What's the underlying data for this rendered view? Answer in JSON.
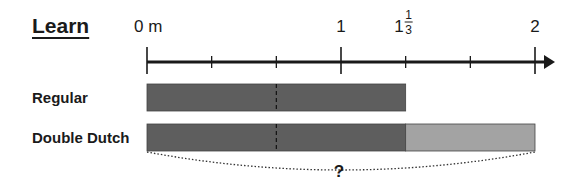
{
  "heading": "Learn",
  "number_line": {
    "unit": "m",
    "min": 0,
    "max": 2,
    "labels": [
      {
        "value": 0,
        "text": "0 m"
      },
      {
        "value": 1,
        "text": "1"
      },
      {
        "value": 1.3333,
        "whole": "1",
        "numerator": "1",
        "denominator": "3"
      },
      {
        "value": 2,
        "text": "2"
      }
    ],
    "major_ticks": [
      0,
      1,
      2
    ],
    "minor_ticks": [
      0.3333,
      0.6667,
      1.3333,
      1.6667
    ]
  },
  "bars": [
    {
      "label": "Regular",
      "segments": [
        {
          "from": 0,
          "to": 1.3333,
          "color": "#5e5e5e"
        }
      ],
      "divider_at": 0.6667
    },
    {
      "label": "Double Dutch",
      "segments": [
        {
          "from": 0,
          "to": 1.3333,
          "color": "#5e5e5e"
        },
        {
          "from": 1.3333,
          "to": 2,
          "color": "#a3a3a3"
        }
      ],
      "divider_at": 0.6667
    }
  ],
  "brace_label": "?",
  "colors": {
    "dark_bar": "#5e5e5e",
    "light_bar": "#a3a3a3",
    "line": "#1a1a1a"
  }
}
